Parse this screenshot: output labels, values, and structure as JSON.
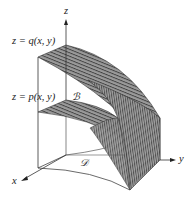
{
  "figure": {
    "type": "3d-region-diagram",
    "axes": {
      "x_label": "x",
      "y_label": "y",
      "z_label": "z"
    },
    "upper_surface": {
      "label": "z = q(x, y)",
      "function": "q(x, y)"
    },
    "lower_surface": {
      "label": "z = p(x, y)",
      "function": "p(x, y)"
    },
    "region_labels": {
      "solid": "ℬ",
      "base_region": "ᵉF"
    },
    "colors": {
      "surface_fill": "#8a8a8a",
      "surface_lines": "#3a3a3a",
      "axis": "#333333",
      "background": "#ffffff"
    }
  },
  "text": {
    "upper_label": "z = q(x, y)",
    "lower_label": "z = p(x, y)",
    "z": "z",
    "y": "y",
    "x": "x",
    "B": "ℬ",
    "D": "𝒟"
  }
}
